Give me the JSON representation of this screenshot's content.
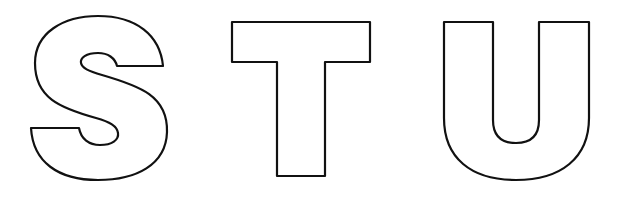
{
  "letters": [
    {
      "char": "S",
      "style": "outline"
    },
    {
      "char": "T",
      "style": "outline"
    },
    {
      "char": "U",
      "style": "outline"
    }
  ],
  "colors": {
    "stroke": "#111111",
    "fill": "#ffffff",
    "background": "#ffffff"
  }
}
